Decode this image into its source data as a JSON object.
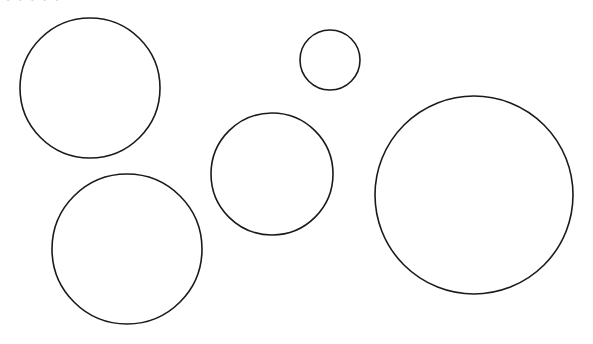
{
  "figure": {
    "background_color": "#ffffff",
    "stroke_color": "#1a1a1a",
    "stroke_width": 1.6,
    "fill": "none",
    "canvas": {
      "width": 593,
      "height": 344
    },
    "artifact_text": "· ı · ı · ı · ı · ı",
    "labels": {
      "circle_1": "Circle A",
      "circle_2": "Circle B",
      "circle_3": "Circle C",
      "circle_4": "Circle D",
      "circle_5": "Circle E"
    }
  },
  "chart_data": {
    "type": "scatter",
    "subtitle": "",
    "xlabel": "",
    "ylabel": "",
    "xlim": [
      0,
      593
    ],
    "ylim": [
      0,
      344
    ],
    "grid": false,
    "legend": "none",
    "marker": "open-circle",
    "units": "pixels",
    "note": "Each data point is an outlined circle; r is the drawn radius.",
    "columns": [
      "name",
      "cx",
      "cy",
      "r",
      "diameter"
    ],
    "points": [
      {
        "name": "Circle A",
        "cx": 90,
        "cy": 88,
        "r": 70,
        "diameter": 140
      },
      {
        "name": "Circle B",
        "cx": 330,
        "cy": 60,
        "r": 30,
        "diameter": 60
      },
      {
        "name": "Circle C",
        "cx": 272,
        "cy": 174,
        "r": 61,
        "diameter": 122
      },
      {
        "name": "Circle D",
        "cx": 127,
        "cy": 249,
        "r": 75,
        "diameter": 150
      },
      {
        "name": "Circle E",
        "cx": 474,
        "cy": 195,
        "r": 99,
        "diameter": 198
      }
    ],
    "radii": [
      70,
      30,
      61,
      75,
      99
    ],
    "x": [
      90,
      330,
      272,
      127,
      474
    ],
    "y": [
      88,
      60,
      174,
      249,
      195
    ]
  }
}
